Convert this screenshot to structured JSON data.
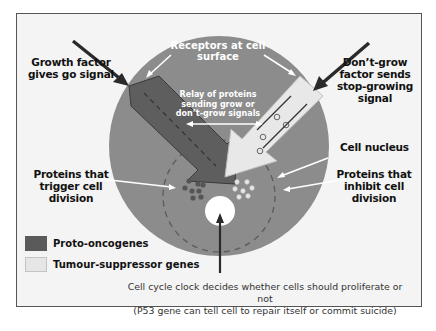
{
  "colors": {
    "cell": "#8c8c8c",
    "proto_oncogene": "#5a5a5a",
    "tumour_suppressor": "#e6e6e6",
    "frame_bg": "#f4f4f4",
    "arrow_dark": "#2a2a2a",
    "white": "#ffffff"
  },
  "labels": {
    "growth_factor": [
      "Growth factor",
      "gives go signal"
    ],
    "dont_grow_factor": [
      "Don’t-grow",
      "factor sends",
      "stop-growing",
      "signal"
    ],
    "receptors": [
      "Receptors at cell",
      "surface"
    ],
    "relay": [
      "Relay of proteins",
      "sending grow or",
      "don’t-grow signals"
    ],
    "cell_nucleus": "Cell nucleus",
    "proteins_trigger": [
      "Proteins that",
      "trigger cell division"
    ],
    "proteins_inhibit": [
      "Proteins that",
      "inhibit cell division"
    ]
  },
  "legend": [
    {
      "label": "Proto-oncogenes",
      "swatch": "#5a5a5a"
    },
    {
      "label": "Tumour-suppressor genes",
      "swatch": "#e6e6e6"
    }
  ],
  "caption": [
    "Cell cycle clock decides whether cells should proliferate or not",
    "(P53 gene can tell cell to repair itself or commit suicide)"
  ]
}
